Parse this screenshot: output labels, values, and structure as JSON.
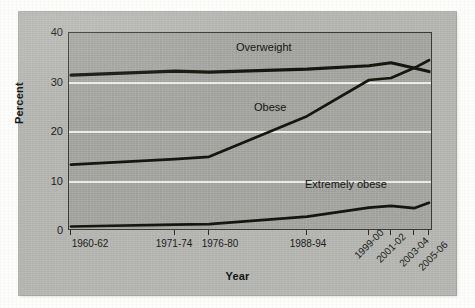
{
  "chart_data": {
    "type": "line",
    "title": "",
    "xlabel": "Year",
    "ylabel": "Percent",
    "ylim": [
      0,
      40
    ],
    "yticks": [
      0,
      10,
      20,
      30,
      40
    ],
    "grid": "horizontal-white-at-10-20-30",
    "legend": "inline-annotations",
    "categories": [
      "1960-62",
      "1971-74",
      "1976-80",
      "1988-94",
      "1999-00",
      "2001-02",
      "2003-04",
      "2005-06"
    ],
    "series": [
      {
        "name": "Overweight",
        "values": [
          31.5,
          32.3,
          32.1,
          32.7,
          33.4,
          34.0,
          32.9,
          32.2
        ]
      },
      {
        "name": "Obese",
        "values": [
          13.4,
          14.5,
          15.0,
          23.2,
          30.5,
          30.9,
          32.9,
          34.5
        ]
      },
      {
        "name": "Extremely obese",
        "values": [
          0.9,
          1.3,
          1.4,
          2.9,
          4.7,
          5.1,
          4.6,
          5.7
        ]
      }
    ],
    "annotations": [
      {
        "text": "Overweight",
        "series": "Overweight"
      },
      {
        "text": "Obese",
        "series": "Obese"
      },
      {
        "text": "Extremely obese",
        "series": "Extremely obese"
      }
    ],
    "colors": {
      "line": "#1a1a18",
      "plot_background": "#a9aaa6",
      "figure_background": "#b9bab6",
      "gridline": "#f2f2ee",
      "axis": "#3b3b39",
      "text": "#1d1d1b"
    }
  },
  "axis": {
    "y_title": "Percent",
    "x_title": "Year",
    "y_tick_labels": [
      "40",
      "30",
      "20",
      "10",
      "0"
    ],
    "x_tick_labels": [
      "1960-62",
      "1971-74",
      "1976-80",
      "1988-94",
      "1999-00",
      "2001-02",
      "2003-04",
      "2005-06"
    ]
  }
}
